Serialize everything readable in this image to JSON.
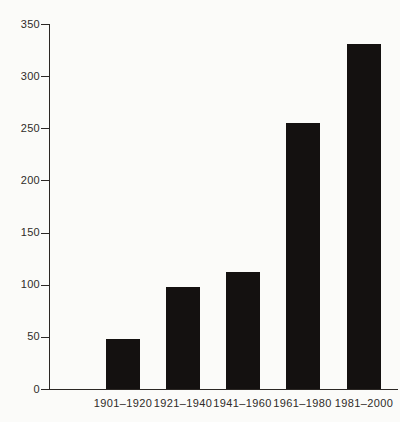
{
  "chart_data": {
    "type": "bar",
    "title": "",
    "xlabel": "",
    "ylabel": "",
    "categories": [
      "1901–1920",
      "1921–1940",
      "1941–1960",
      "1961–1980",
      "1981–2000"
    ],
    "values": [
      48,
      98,
      112,
      255,
      331
    ],
    "ylim": [
      0,
      350
    ],
    "yticks": [
      0,
      50,
      100,
      150,
      200,
      250,
      300,
      350
    ],
    "grid": false,
    "legend": false,
    "bar_color": "#141110",
    "axis_color": "#2b2724",
    "label_color": "#2f2b28",
    "background_color": "#fbfbf9"
  }
}
